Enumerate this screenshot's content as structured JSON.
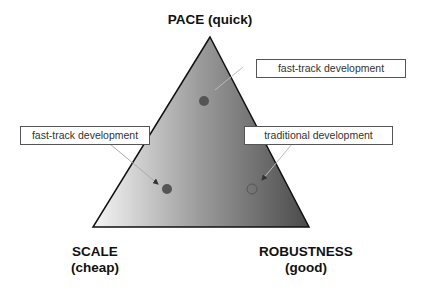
{
  "vertices": {
    "top": {
      "line1": "PACE (quick)"
    },
    "bottom_left": {
      "line1": "SCALE",
      "line2": "(cheap)"
    },
    "bottom_right": {
      "line1": "ROBUSTNESS",
      "line2": "(good)"
    }
  },
  "callouts": [
    {
      "id": "top-right",
      "text": "fast-track development"
    },
    {
      "id": "left",
      "text": "fast-track development"
    },
    {
      "id": "right",
      "text": "traditional development"
    }
  ],
  "colors": {
    "gradient_left": "#f4f4f4",
    "gradient_right": "#444444",
    "dot_fill": "#555555",
    "outline": "#111111"
  }
}
